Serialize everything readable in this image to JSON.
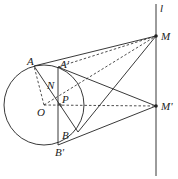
{
  "labels": {
    "l": "l",
    "M": "M",
    "M_prime": "M'",
    "A": "A",
    "A_prime": "A'",
    "N": "N",
    "P": "P",
    "O": "O",
    "B": "B",
    "B_prime": "B'"
  },
  "colors": {
    "stroke": "#222222",
    "background": "#ffffff"
  }
}
